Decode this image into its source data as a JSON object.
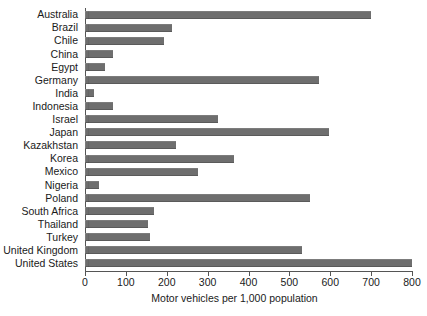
{
  "chart_data": {
    "type": "bar",
    "orientation": "horizontal",
    "title": "",
    "xlabel": "Motor vehicles per 1,000 population",
    "ylabel": "",
    "xlim": [
      0,
      800
    ],
    "xticks": [
      0,
      100,
      200,
      300,
      400,
      500,
      600,
      700,
      800
    ],
    "grid": false,
    "legend": false,
    "bar_color": "#6e6e6e",
    "categories": [
      "Australia",
      "Brazil",
      "Chile",
      "China",
      "Egypt",
      "Germany",
      "India",
      "Indonesia",
      "Israel",
      "Japan",
      "Kazakhstan",
      "Korea",
      "Mexico",
      "Nigeria",
      "Poland",
      "South Africa",
      "Thailand",
      "Turkey",
      "United Kingdom",
      "United States"
    ],
    "values": [
      700,
      213,
      193,
      69,
      50,
      572,
      22,
      69,
      325,
      597,
      222,
      364,
      276,
      34,
      550,
      169,
      155,
      159,
      530,
      800
    ]
  }
}
